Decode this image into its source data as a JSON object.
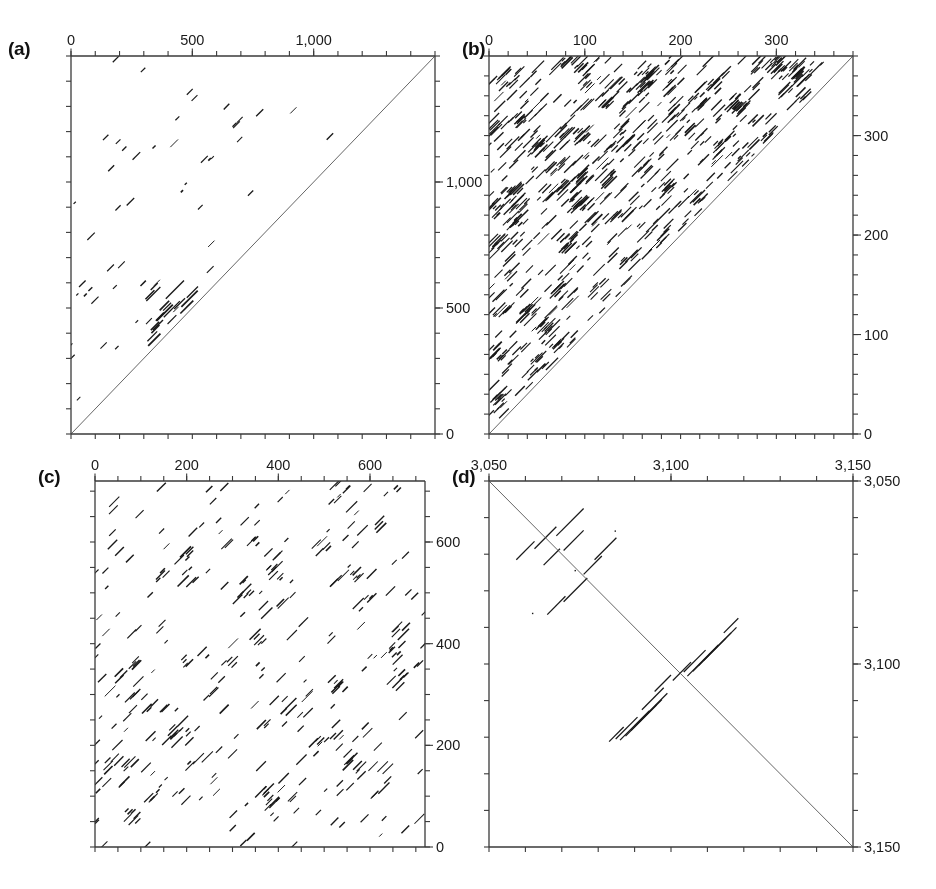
{
  "figure": {
    "background": "#ffffff",
    "ink": "#1a1a1a",
    "axis_color": "#3a3a3a"
  },
  "panels": [
    {
      "id": "a",
      "label": "(a)",
      "label_x": 8,
      "label_y": 38,
      "plot_x": 71,
      "plot_y": 56,
      "plot_w": 364,
      "plot_h": 378,
      "top_axis": {
        "position": "top",
        "min": 0,
        "max": 1500,
        "labeled_ticks": [
          {
            "value": 0,
            "text": "0"
          },
          {
            "value": 500,
            "text": "500"
          },
          {
            "value": 1000,
            "text": "1,000"
          }
        ],
        "minor_tick_step": 100
      },
      "right_axis": {
        "position": "right",
        "min": 0,
        "max": 1500,
        "direction": "up",
        "labeled_ticks": [
          {
            "value": 0,
            "text": "0"
          },
          {
            "value": 500,
            "text": "500"
          },
          {
            "value": 1000,
            "text": "1,000"
          }
        ],
        "minor_tick_step": 100
      },
      "bottom_axis": {
        "position": "bottom",
        "labeled_ticks": [],
        "minor_tick_step": 100
      },
      "left_axis": {
        "position": "left",
        "labeled_ticks": [],
        "minor_tick_step": 100
      },
      "diagonal": "bottom-left-to-top-right",
      "fill_region": "above-diagonal",
      "density": 0.00052,
      "seed": 1471,
      "cluster_count": 26,
      "cluster_spread": 0.055,
      "cluster_density": 0.26,
      "segment_len_min": 3,
      "segment_len_max": 11,
      "blocks": [
        {
          "cx": 0.3,
          "cy": 0.3,
          "w": 0.17,
          "h": 0.17,
          "count": 46,
          "len_min": 10,
          "len_max": 26
        }
      ]
    },
    {
      "id": "b",
      "label": "(b)",
      "label_x": 462,
      "label_y": 38,
      "plot_x": 489,
      "plot_y": 56,
      "plot_w": 364,
      "plot_h": 378,
      "top_axis": {
        "position": "top",
        "min": 0,
        "max": 380,
        "labeled_ticks": [
          {
            "value": 0,
            "text": "0"
          },
          {
            "value": 100,
            "text": "100"
          },
          {
            "value": 200,
            "text": "200"
          },
          {
            "value": 300,
            "text": "300"
          }
        ],
        "minor_tick_step": 20
      },
      "right_axis": {
        "position": "right",
        "min": 0,
        "max": 380,
        "direction": "up",
        "labeled_ticks": [
          {
            "value": 0,
            "text": "0"
          },
          {
            "value": 100,
            "text": "100"
          },
          {
            "value": 200,
            "text": "200"
          },
          {
            "value": 300,
            "text": "300"
          }
        ],
        "minor_tick_step": 20
      },
      "bottom_axis": {
        "position": "bottom",
        "labeled_ticks": [],
        "minor_tick_step": 20
      },
      "left_axis": {
        "position": "left",
        "labeled_ticks": [],
        "minor_tick_step": 20
      },
      "diagonal": "bottom-left-to-top-right",
      "fill_region": "above-diagonal",
      "density": 0.0075,
      "seed": 8823,
      "cluster_count": 150,
      "cluster_spread": 0.035,
      "cluster_density": 0.9,
      "segment_len_min": 4,
      "segment_len_max": 18,
      "blocks": []
    },
    {
      "id": "c",
      "label": "(c)",
      "label_x": 38,
      "label_y": 466,
      "plot_x": 95,
      "plot_y": 481,
      "plot_w": 330,
      "plot_h": 366,
      "top_axis": {
        "position": "top",
        "min": 0,
        "max": 720,
        "labeled_ticks": [
          {
            "value": 0,
            "text": "0"
          },
          {
            "value": 200,
            "text": "200"
          },
          {
            "value": 400,
            "text": "400"
          },
          {
            "value": 600,
            "text": "600"
          }
        ],
        "minor_tick_step": 50
      },
      "right_axis": {
        "position": "right",
        "min": 0,
        "max": 720,
        "direction": "up",
        "labeled_ticks": [
          {
            "value": 0,
            "text": "0"
          },
          {
            "value": 200,
            "text": "200"
          },
          {
            "value": 400,
            "text": "400"
          },
          {
            "value": 600,
            "text": "600"
          }
        ],
        "minor_tick_step": 50
      },
      "bottom_axis": {
        "position": "bottom",
        "labeled_ticks": [],
        "minor_tick_step": 50
      },
      "left_axis": {
        "position": "left",
        "labeled_ticks": [],
        "minor_tick_step": 50
      },
      "diagonal": "none",
      "fill_region": "full-square",
      "density": 0.0016,
      "seed": 3307,
      "cluster_count": 70,
      "cluster_spread": 0.045,
      "cluster_density": 0.42,
      "segment_len_min": 4,
      "segment_len_max": 16,
      "blocks": []
    },
    {
      "id": "d",
      "label": "(d)",
      "label_x": 452,
      "label_y": 466,
      "plot_x": 489,
      "plot_y": 481,
      "plot_w": 364,
      "plot_h": 366,
      "top_axis": {
        "position": "top",
        "min": 3050,
        "max": 3150,
        "labeled_ticks": [
          {
            "value": 3050,
            "text": "3,050"
          },
          {
            "value": 3100,
            "text": "3,100"
          },
          {
            "value": 3150,
            "text": "3,150"
          }
        ],
        "minor_tick_step": 10
      },
      "right_axis": {
        "position": "right",
        "min": 3050,
        "max": 3150,
        "direction": "down",
        "labeled_ticks": [
          {
            "value": 3050,
            "text": "3,050"
          },
          {
            "value": 3100,
            "text": "3,100"
          },
          {
            "value": 3150,
            "text": "3,150"
          }
        ],
        "minor_tick_step": 10
      },
      "bottom_axis": {
        "position": "bottom",
        "labeled_ticks": [],
        "minor_tick_step": 10
      },
      "left_axis": {
        "position": "left",
        "labeled_ticks": [],
        "minor_tick_step": 10
      },
      "diagonal": "top-left-to-bottom-right",
      "fill_region": "sparse-antidiagonal",
      "density": 0,
      "seed": 5150,
      "cluster_count": 0,
      "cluster_spread": 0,
      "cluster_density": 0,
      "segment_len_min": 0,
      "segment_len_max": 0,
      "blocks": [],
      "anti_segments": [
        {
          "x": 0.185,
          "y": 0.075,
          "len": 0.075
        },
        {
          "x": 0.125,
          "y": 0.125,
          "len": 0.06
        },
        {
          "x": 0.205,
          "y": 0.135,
          "len": 0.055
        },
        {
          "x": 0.075,
          "y": 0.165,
          "len": 0.05
        },
        {
          "x": 0.15,
          "y": 0.185,
          "len": 0.045
        },
        {
          "x": 0.29,
          "y": 0.155,
          "len": 0.06
        },
        {
          "x": 0.26,
          "y": 0.205,
          "len": 0.05
        },
        {
          "x": 0.205,
          "y": 0.265,
          "len": 0.065
        },
        {
          "x": 0.16,
          "y": 0.315,
          "len": 0.05
        },
        {
          "x": 0.645,
          "y": 0.375,
          "len": 0.04
        },
        {
          "x": 0.59,
          "y": 0.4,
          "len": 0.09
        },
        {
          "x": 0.575,
          "y": 0.415,
          "len": 0.09
        },
        {
          "x": 0.56,
          "y": 0.43,
          "len": 0.09
        },
        {
          "x": 0.545,
          "y": 0.448,
          "len": 0.085
        },
        {
          "x": 0.535,
          "y": 0.462,
          "len": 0.06
        },
        {
          "x": 0.505,
          "y": 0.495,
          "len": 0.05
        },
        {
          "x": 0.455,
          "y": 0.53,
          "len": 0.045
        },
        {
          "x": 0.42,
          "y": 0.565,
          "len": 0.06
        },
        {
          "x": 0.405,
          "y": 0.58,
          "len": 0.085
        },
        {
          "x": 0.39,
          "y": 0.597,
          "len": 0.085
        },
        {
          "x": 0.375,
          "y": 0.612,
          "len": 0.085
        },
        {
          "x": 0.36,
          "y": 0.628,
          "len": 0.08
        },
        {
          "x": 0.348,
          "y": 0.645,
          "len": 0.06
        },
        {
          "x": 0.33,
          "y": 0.672,
          "len": 0.04
        }
      ],
      "stray_dots": [
        {
          "x": 0.345,
          "y": 0.135
        },
        {
          "x": 0.118,
          "y": 0.36
        },
        {
          "x": 0.235,
          "y": 0.243
        }
      ]
    }
  ],
  "chart_data": {
    "type": "scatter",
    "title": "",
    "subtitle": "",
    "panels": [
      {
        "name": "a",
        "xlabel": "",
        "ylabel": "",
        "xlim": [
          0,
          1500
        ],
        "ylim": [
          0,
          1500
        ],
        "xticks": [
          0,
          500,
          1000
        ],
        "xticklabels": [
          "0",
          "500",
          "1,000"
        ],
        "yticks": [
          0,
          500,
          1000
        ],
        "yticklabels": [
          "0",
          "500",
          "1,000"
        ],
        "y_axis_side": "right",
        "x_axis_side": "top",
        "grid": false,
        "legend": "none",
        "features": "sparse scattered short diagonal segments in the upper triangle; dense tandem-repeat block near coordinates (300-600, 300-600)"
      },
      {
        "name": "b",
        "xlabel": "",
        "ylabel": "",
        "xlim": [
          0,
          380
        ],
        "ylim": [
          0,
          380
        ],
        "xticks": [
          0,
          100,
          200,
          300
        ],
        "xticklabels": [
          "0",
          "100",
          "200",
          "300"
        ],
        "yticks": [
          0,
          100,
          200,
          300
        ],
        "yticklabels": [
          "0",
          "100",
          "200",
          "300"
        ],
        "y_axis_side": "right",
        "x_axis_side": "top",
        "grid": false,
        "legend": "none",
        "features": "very dense short diagonal segments filling the whole upper triangle"
      },
      {
        "name": "c",
        "xlabel": "",
        "ylabel": "",
        "xlim": [
          0,
          720
        ],
        "ylim": [
          0,
          720
        ],
        "xticks": [
          0,
          200,
          400,
          600
        ],
        "xticklabels": [
          "0",
          "200",
          "400",
          "600"
        ],
        "yticks": [
          0,
          200,
          400,
          600
        ],
        "yticklabels": [
          "0",
          "200",
          "400",
          "600"
        ],
        "y_axis_side": "right",
        "x_axis_side": "top",
        "grid": false,
        "legend": "none",
        "features": "full square matrix of moderately sparse short diagonal segments; no main diagonal drawn"
      },
      {
        "name": "d",
        "xlabel": "",
        "ylabel": "",
        "xlim": [
          3050,
          3150
        ],
        "ylim": [
          3150,
          3050
        ],
        "xticks": [
          3050,
          3100,
          3150
        ],
        "xticklabels": [
          "3,050",
          "3,100",
          "3,150"
        ],
        "yticks": [
          3050,
          3100,
          3150
        ],
        "yticklabels": [
          "3,050",
          "3,100",
          "3,150"
        ],
        "y_axis_side": "right",
        "x_axis_side": "top",
        "grid": false,
        "legend": "none",
        "features": "continuous main diagonal top-left to bottom-right; two symmetric clusters of anti-diagonal segments (inverted repeats) near 3,080 and 3,110; scattered short anti-diagonal segments in the upper-left quadrant"
      }
    ]
  }
}
